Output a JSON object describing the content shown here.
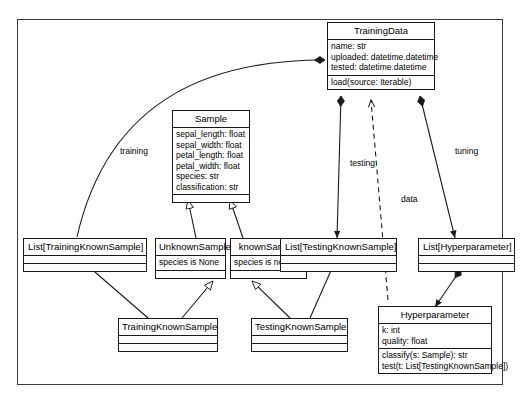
{
  "diagram": {
    "classes": [
      {
        "id": "training-data",
        "name": "TrainingData",
        "attributes": [
          "name: str",
          "uploaded: datetime.datetime",
          "tested: datetime.datetime"
        ],
        "methods": [
          "load(source: Iterable)"
        ]
      },
      {
        "id": "sample",
        "name": "Sample",
        "attributes": [
          "sepal_length: float",
          "sepal_width: float",
          "petal_length: float",
          "petal_width: float",
          "species: str",
          "classification: str"
        ],
        "methods": []
      },
      {
        "id": "list-training-known-sample",
        "name": "List[TrainingKnownSample]",
        "attributes": [],
        "methods": []
      },
      {
        "id": "unknown-sample",
        "name": "UnknownSample",
        "attributes": [
          "species is None"
        ],
        "methods": []
      },
      {
        "id": "known-sample",
        "name": "knownSample",
        "attributes": [
          "species is not None"
        ],
        "methods": []
      },
      {
        "id": "list-testing-known-sample",
        "name": "List[TestingKnownSample]",
        "attributes": [],
        "methods": []
      },
      {
        "id": "list-hyperparameter",
        "name": "List[Hyperparameter]",
        "attributes": [],
        "methods": []
      },
      {
        "id": "training-known-sample",
        "name": "TrainingKnownSample",
        "attributes": [],
        "methods": []
      },
      {
        "id": "testing-known-sample",
        "name": "TestingKnownSample",
        "attributes": [],
        "methods": []
      },
      {
        "id": "hyperparameter",
        "name": "Hyperparameter",
        "attributes": [
          "k: int",
          "quality: float"
        ],
        "methods": [
          "classify(s: Sample): str",
          "test(t: List[TestingKnownSample])"
        ]
      }
    ],
    "edge_labels": [
      {
        "id": "training",
        "text": "training"
      },
      {
        "id": "testing",
        "text": "testing"
      },
      {
        "id": "data",
        "text": "data"
      },
      {
        "id": "tuning",
        "text": "tuning"
      }
    ],
    "colors": {
      "line": "#1a1a1a",
      "frame": "#3a3a3a",
      "background": "#ffffff",
      "text": "#000000"
    }
  }
}
